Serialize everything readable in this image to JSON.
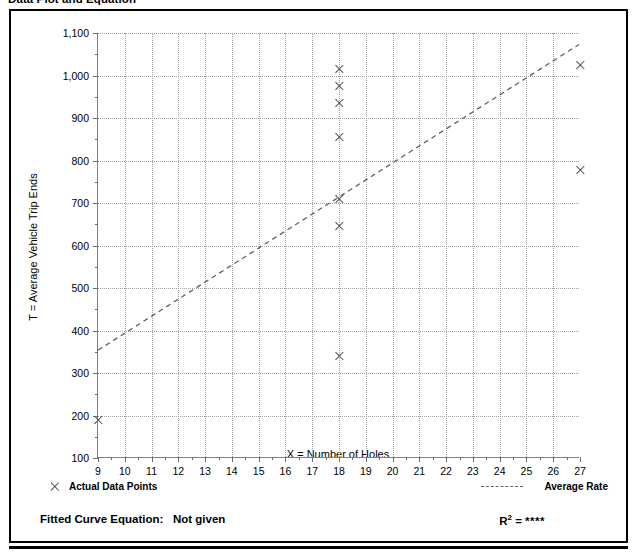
{
  "title": "Data Plot and Equation",
  "chart_data": {
    "type": "scatter",
    "title": "Data Plot and Equation",
    "xlabel": "X = Number of Holes",
    "ylabel": "T = Average Vehicle Trip Ends",
    "xlim": [
      9,
      27
    ],
    "ylim": [
      100,
      1100
    ],
    "xticks": [
      9,
      10,
      11,
      12,
      13,
      14,
      15,
      16,
      17,
      18,
      19,
      20,
      21,
      22,
      23,
      24,
      25,
      26,
      27
    ],
    "xtick_labels": [
      "9",
      "10",
      "11",
      "12",
      "13",
      "14",
      "15",
      "16",
      "17",
      "18",
      "19",
      "20",
      "21",
      "22",
      "23",
      "24",
      "25",
      "26",
      "27"
    ],
    "yticks": [
      100,
      200,
      300,
      400,
      500,
      600,
      700,
      800,
      900,
      1000,
      1100
    ],
    "ytick_labels": [
      "100",
      "200",
      "300",
      "400",
      "500",
      "600",
      "700",
      "800",
      "900",
      "1,000",
      "1,100"
    ],
    "x_minor_step": 0.5,
    "y_minor_step": 50,
    "grid": true,
    "grid_style": "dotted",
    "legend_position": "below-plot",
    "series": [
      {
        "name": "Actual Data Points",
        "type": "scatter",
        "marker": "x",
        "color": "#4a4a4a",
        "points": [
          {
            "x": 9,
            "y": 190
          },
          {
            "x": 18,
            "y": 1015
          },
          {
            "x": 18,
            "y": 975
          },
          {
            "x": 18,
            "y": 935
          },
          {
            "x": 18,
            "y": 855
          },
          {
            "x": 18,
            "y": 710
          },
          {
            "x": 18,
            "y": 645
          },
          {
            "x": 18,
            "y": 340
          },
          {
            "x": 27,
            "y": 1025
          },
          {
            "x": 27,
            "y": 778
          }
        ]
      },
      {
        "name": "Average Rate",
        "type": "line",
        "style": "dashed",
        "color": "#606060",
        "endpoints": [
          {
            "x": 9,
            "y": 352
          },
          {
            "x": 27,
            "y": 1073
          }
        ]
      }
    ]
  },
  "legend": {
    "data_points_label": "Actual Data Points",
    "average_rate_label": "Average Rate",
    "data_points_marker": "x-marker-icon",
    "average_rate_marker": "dashed-line-icon"
  },
  "footer": {
    "equation_label": "Fitted Curve Equation:",
    "equation_value": "Not given",
    "r2_label": "R",
    "r2_exponent": "2",
    "r2_equals": "=",
    "r2_value": "****"
  }
}
